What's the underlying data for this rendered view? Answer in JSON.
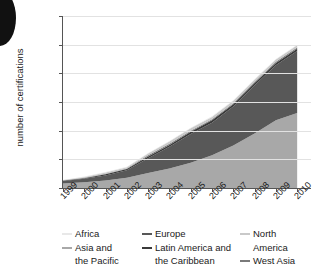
{
  "chart": {
    "ylabel": "number of certifications",
    "yticks": [
      "0",
      "50",
      "100",
      "150",
      "200",
      "250",
      "300"
    ],
    "xticks": [
      "1999",
      "2000",
      "2001",
      "2002",
      "2003",
      "2004",
      "2005",
      "2006",
      "2007",
      "2008",
      "2009",
      "2010"
    ]
  },
  "legend": {
    "columns": [
      {
        "items": [
          {
            "label": "Africa",
            "color": "#e8e8e8",
            "swatch": true
          },
          {
            "label": "Asia and",
            "continuation": "the Pacific",
            "color": "#a8a8a8",
            "swatch": true
          }
        ]
      },
      {
        "items": [
          {
            "label": "Europe",
            "color": "#585858",
            "swatch": true
          },
          {
            "label": "Latin America and",
            "continuation": "the Caribbean",
            "color": "#3a3a3a",
            "swatch": true
          }
        ]
      },
      {
        "items": [
          {
            "label": "North",
            "continuation": "America",
            "color": "#c9c9c9",
            "swatch": true
          },
          {
            "label": "West Asia",
            "color": "#7a7a7a",
            "swatch": true
          }
        ]
      }
    ]
  },
  "chart_data": {
    "type": "area",
    "stacked": true,
    "title": "",
    "xlabel": "",
    "ylabel": "number of certifications",
    "ylim": [
      0,
      300
    ],
    "ytick_step": 50,
    "grid": true,
    "legend_position": "bottom",
    "x": [
      1999,
      2000,
      2001,
      2002,
      2003,
      2004,
      2005,
      2006,
      2007,
      2008,
      2009,
      2010
    ],
    "series": [
      {
        "name": "Asia and the Pacific",
        "color": "#a8a8a8",
        "values": [
          8,
          10,
          13,
          18,
          26,
          34,
          44,
          57,
          74,
          95,
          118,
          131
        ]
      },
      {
        "name": "Europe",
        "color": "#585858",
        "values": [
          4,
          6,
          9,
          13,
          26,
          38,
          50,
          57,
          68,
          84,
          96,
          108
        ]
      },
      {
        "name": "Latin America and the Caribbean",
        "color": "#3a3a3a",
        "values": [
          1,
          1,
          2,
          2,
          3,
          3,
          4,
          4,
          4,
          4,
          4,
          4
        ]
      },
      {
        "name": "West Asia",
        "color": "#7a7a7a",
        "values": [
          0,
          1,
          1,
          1,
          2,
          2,
          2,
          2,
          2,
          2,
          2,
          2
        ]
      },
      {
        "name": "North America",
        "color": "#c9c9c9",
        "values": [
          1,
          1,
          2,
          2,
          3,
          4,
          4,
          4,
          4,
          4,
          4,
          4
        ]
      },
      {
        "name": "Africa",
        "color": "#e8e8e8",
        "values": [
          0,
          1,
          1,
          1,
          1,
          1,
          1,
          1,
          1,
          1,
          1,
          1
        ]
      }
    ],
    "totals": [
      14,
      20,
      28,
      37,
      61,
      82,
      105,
      125,
      153,
      190,
      225,
      250
    ]
  }
}
